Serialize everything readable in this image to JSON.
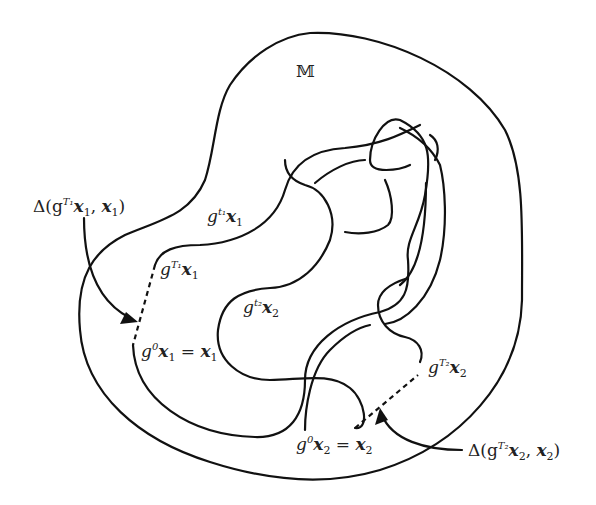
{
  "figure": {
    "manifold_label": "𝕄",
    "labels": {
      "delta1": {
        "prefix": "Δ(g",
        "sup": "T₁",
        "body": "x",
        "sub": "1",
        "mid": ", ",
        "body2": "x",
        "sub2": "1",
        "suffix": ")"
      },
      "gt1x1": {
        "g": "g",
        "sup": "t₁",
        "x": "x",
        "sub": "1"
      },
      "gT1x1": {
        "g": "g",
        "sup": "T₁",
        "x": "x",
        "sub": "1"
      },
      "gt2x2": {
        "g": "g",
        "sup": "t₂",
        "x": "x",
        "sub": "2"
      },
      "g0x1": {
        "g": "g",
        "sup": "0",
        "x": "x",
        "sub": "1",
        "eq": " = ",
        "x2": "x",
        "sub2": "1"
      },
      "gT2x2": {
        "g": "g",
        "sup": "T₂",
        "x": "x",
        "sub": "2"
      },
      "g0x2": {
        "g": "g",
        "sup": "0",
        "x": "x",
        "sub": "2",
        "eq": " = ",
        "x2": "x",
        "sub2": "2"
      },
      "delta2": {
        "prefix": "Δ(g",
        "sup": "T₂",
        "body": "x",
        "sub": "2",
        "mid": ", ",
        "body2": "x",
        "sub2": "2",
        "suffix": ")"
      }
    }
  }
}
